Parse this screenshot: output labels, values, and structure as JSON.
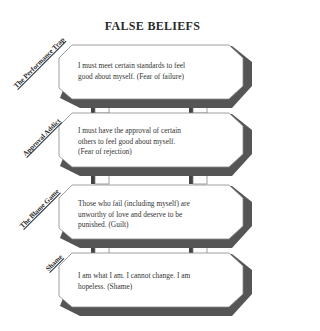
{
  "title": "FALSE BELIEFS",
  "colors": {
    "shadow": "#555555",
    "outline": "#888888",
    "box_fill": "#ffffff",
    "text": "#333333"
  },
  "beliefs": [
    {
      "label": "The Performance Trap",
      "text_lines": [
        "I must meet certain standards to feel",
        "good about myself. (Fear of failure)"
      ]
    },
    {
      "label": "Approval Addict",
      "text_lines": [
        "I must have the approval of certain",
        "others to feel good about myself.",
        "(Fear of rejection)"
      ]
    },
    {
      "label": "The Blame Game",
      "text_lines": [
        "Those who fail (including myself) are",
        "unworthy of love and deserve to be",
        "punished. (Guilt)"
      ]
    },
    {
      "label": "Shame",
      "text_lines": [
        "I am what I am. I cannot change. I am",
        "hopeless. (Shame)"
      ]
    }
  ]
}
